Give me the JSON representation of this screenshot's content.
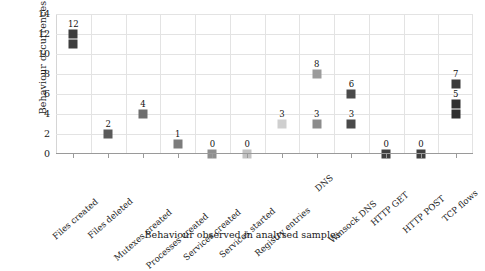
{
  "chart_data": {
    "type": "scatter",
    "title": "",
    "xlabel": "Behaviour observed in analysed samples",
    "ylabel": "Behaviour occurrences",
    "ylim": [
      0,
      14
    ],
    "yticks": [
      0,
      2,
      4,
      6,
      8,
      10,
      12,
      14
    ],
    "grid": true,
    "legend": "none",
    "marker": "square",
    "categories": [
      "Files created",
      "Files deleted",
      "Mutexes created",
      "Processes created",
      "Services created",
      "Services started",
      "Registry entries",
      "DNS",
      "Winsock DNS",
      "HTTP GET",
      "HTTP POST",
      "TCP flows"
    ],
    "points": [
      {
        "category": "Files created",
        "values": [
          12,
          11
        ],
        "labels": [
          "12"
        ],
        "colors": [
          "#3d3d3d",
          "#3d3d3d"
        ]
      },
      {
        "category": "Files deleted",
        "values": [
          2
        ],
        "labels": [
          "2"
        ],
        "colors": [
          "#5a5a5a"
        ]
      },
      {
        "category": "Mutexes created",
        "values": [
          4
        ],
        "labels": [
          "4"
        ],
        "colors": [
          "#6e6e6e"
        ]
      },
      {
        "category": "Processes created",
        "values": [
          1
        ],
        "labels": [
          "1"
        ],
        "colors": [
          "#7c7c7c"
        ]
      },
      {
        "category": "Services created",
        "values": [
          0
        ],
        "labels": [
          "0"
        ],
        "colors": [
          "#8f8f8f"
        ]
      },
      {
        "category": "Services started",
        "values": [
          0
        ],
        "labels": [
          "0"
        ],
        "colors": [
          "#c2c2c2"
        ]
      },
      {
        "category": "Registry entries",
        "values": [
          3
        ],
        "labels": [
          "3"
        ],
        "colors": [
          "#cfcfcf"
        ]
      },
      {
        "category": "DNS",
        "values": [
          8,
          3
        ],
        "labels": [
          "8",
          "3"
        ],
        "colors": [
          "#9b9b9b",
          "#8c8c8c"
        ]
      },
      {
        "category": "Winsock DNS",
        "values": [
          6,
          3
        ],
        "labels": [
          "6",
          "3"
        ],
        "colors": [
          "#4a4a4a",
          "#4a4a4a"
        ]
      },
      {
        "category": "HTTP GET",
        "values": [
          0
        ],
        "labels": [
          "0"
        ],
        "colors": [
          "#3f3f3f"
        ]
      },
      {
        "category": "HTTP POST",
        "values": [
          0
        ],
        "labels": [
          "0"
        ],
        "colors": [
          "#3f3f3f"
        ]
      },
      {
        "category": "TCP flows",
        "values": [
          7,
          5,
          4
        ],
        "labels": [
          "7",
          "5"
        ],
        "colors": [
          "#3a3a3a",
          "#2f2f2f",
          "#2f2f2f"
        ]
      }
    ]
  }
}
